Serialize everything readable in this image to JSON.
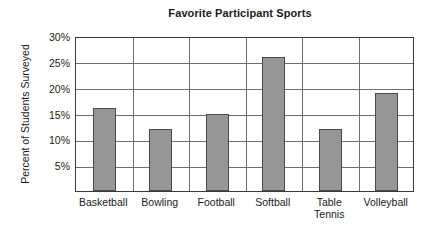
{
  "chart_data": {
    "type": "bar",
    "title": "Favorite Participant Sports",
    "xlabel": "",
    "ylabel": "Percent of Students Surveyed",
    "categories": [
      "Basketball",
      "Bowling",
      "Football",
      "Softball",
      "Table Tennis",
      "Volleyball"
    ],
    "values": [
      16,
      12,
      15,
      26,
      12,
      19
    ],
    "ylim": [
      0,
      30
    ],
    "ytick_values": [
      5,
      10,
      15,
      20,
      25,
      30
    ],
    "ytick_labels": [
      "5%",
      "10%",
      "15%",
      "20%",
      "25%",
      "30%"
    ],
    "grid": "horizontal-and-vertical",
    "legend": "none",
    "bar_color": "#969696",
    "bar_border_color": "#4a4a4a",
    "gridline_color": "#6e6e6e",
    "frame_color": "#3a3a3a",
    "background_color": "#ffffff"
  }
}
